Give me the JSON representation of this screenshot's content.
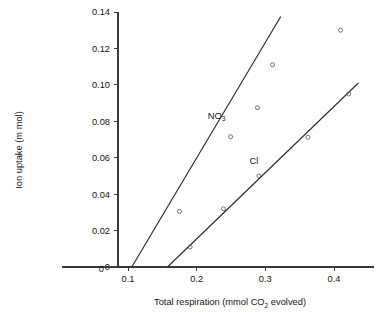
{
  "chart_data": {
    "type": "scatter",
    "title": "",
    "xlabel": "Total respiration (mmol CO2 evolved)",
    "xlabel_main": "Total respiration (mmol CO",
    "xlabel_sub": "2",
    "xlabel_tail": " evolved)",
    "ylabel": "Ion uptake (m mol)",
    "xlim": [
      0,
      0.455
    ],
    "ylim": [
      0,
      0.14
    ],
    "grid": false,
    "legend": "inline-labels",
    "xticks": [
      0,
      0.1,
      0.2,
      0.3,
      0.4
    ],
    "xticklabels": [
      "0",
      "0.1",
      "0.2",
      "0.3",
      "0.4"
    ],
    "yticks": [
      0,
      0.02,
      0.04,
      0.06,
      0.08,
      0.1,
      0.12,
      0.14
    ],
    "yticklabels": [
      "0",
      "0.02",
      "0.04",
      "0.06",
      "0.08",
      "0.10",
      "0.12",
      "0.14"
    ],
    "series": [
      {
        "name": "NO3",
        "label_main": "NO",
        "label_sub": "3",
        "label_x": 0.229,
        "label_y": 0.0815,
        "marker": "open-circle",
        "fit_line": {
          "x_start": 0.1055,
          "y_start": 0.0,
          "x_end": 0.3225,
          "y_end": 0.1375
        },
        "points": [
          {
            "x": 0.175,
            "y": 0.0305
          },
          {
            "x": 0.2495,
            "y": 0.0715
          },
          {
            "x": 0.2885,
            "y": 0.0875
          },
          {
            "x": 0.3105,
            "y": 0.111
          },
          {
            "x": 0.4095,
            "y": 0.13
          }
        ]
      },
      {
        "name": "Cl",
        "label_main": "Cl",
        "label_sub": "",
        "label_x": 0.2835,
        "label_y": 0.0565,
        "marker": "open-circle",
        "fit_line": {
          "x_start": 0.1575,
          "y_start": 0.0,
          "x_end": 0.4355,
          "y_end": 0.101
        },
        "points": [
          {
            "x": 0.1905,
            "y": 0.011
          },
          {
            "x": 0.239,
            "y": 0.032
          },
          {
            "x": 0.2905,
            "y": 0.05
          },
          {
            "x": 0.362,
            "y": 0.0712
          },
          {
            "x": 0.4215,
            "y": 0.095
          }
        ]
      }
    ]
  },
  "colors": {
    "axis": "#3a3a3a",
    "line": "#2b2b2b",
    "marker": "#5d5d5d",
    "text": "#141414",
    "background": "#ffffff"
  }
}
